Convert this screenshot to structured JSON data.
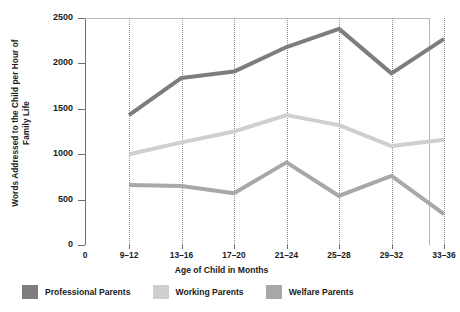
{
  "chart_data": {
    "type": "line",
    "title": "",
    "xlabel": "Age of Child in Months",
    "ylabel": "Words Addressed to the Child per Hour of Family Life",
    "categories": [
      "9–12",
      "13–16",
      "17–20",
      "21–24",
      "25–28",
      "29–32",
      "33–36"
    ],
    "x_axis_origin_label": "0",
    "xtick_labels": [
      "0",
      "9–12",
      "13–16",
      "17–20",
      "21–24",
      "25–28",
      "29–32",
      "33–36"
    ],
    "ylim": [
      0,
      2500
    ],
    "ytick_labels": [
      "0",
      "500",
      "1000",
      "1500",
      "2000",
      "2500"
    ],
    "ytick_values": [
      0,
      500,
      1000,
      1500,
      2000,
      2500
    ],
    "grid": "vertical-dotted",
    "legend_position": "bottom",
    "series": [
      {
        "name": "Professional Parents",
        "color": "#7d7d7d",
        "values": [
          1430,
          1840,
          1910,
          2180,
          2380,
          1890,
          2270
        ]
      },
      {
        "name": "Working Parents",
        "color": "#cfcfcf",
        "values": [
          1000,
          1130,
          1250,
          1430,
          1320,
          1090,
          1160
        ]
      },
      {
        "name": "Welfare Parents",
        "color": "#a8a8a8",
        "values": [
          660,
          650,
          570,
          910,
          540,
          760,
          340
        ]
      }
    ]
  },
  "axes": {
    "y_title": "Words Addressed to the Child per Hour of Family Life",
    "x_title": "Age of Child in Months"
  },
  "legend": {
    "items": [
      {
        "label": "Professional Parents",
        "color": "#7d7d7d"
      },
      {
        "label": "Working Parents",
        "color": "#cfcfcf"
      },
      {
        "label": "Welfare Parents",
        "color": "#a8a8a8"
      }
    ]
  }
}
